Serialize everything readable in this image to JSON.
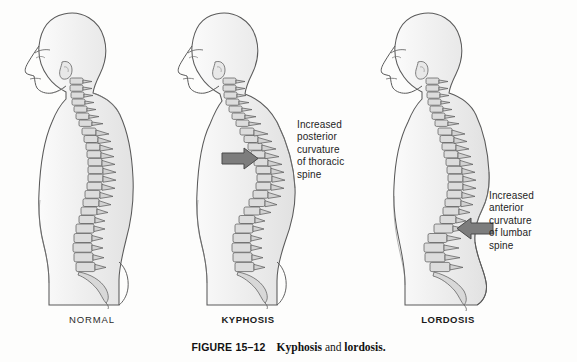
{
  "page": {
    "background_color": "#fdfdfc",
    "ink_color": "#2a2a2a",
    "body_fill": "#efefef",
    "bone_fill": "#d8d8d8",
    "arrow_color": "#7d7d7d",
    "arrow_outline": "#4a4a4a"
  },
  "caption": {
    "figure_number": "FIGURE 15–12",
    "term_1": "Kyphosis",
    "conjunction": " and ",
    "term_2": "lordosis."
  },
  "figures": [
    {
      "id": "normal",
      "label": "NORMAL",
      "label_style": "regular",
      "condition": "normal spinal curvature",
      "description": "Lateral view of a human torso and head showing normal cervical lordosis, thoracic kyphosis and lumbar lordosis of the vertebral column",
      "has_arrow": false,
      "annotation": null
    },
    {
      "id": "kyphosis",
      "label": "KYPHOSIS",
      "label_style": "bold",
      "condition": "exaggerated thoracic curvature",
      "description": "Lateral view showing a pronounced posterior hump of the thoracic spine with forward head posture",
      "has_arrow": true,
      "arrow_direction": "right",
      "annotation": "Increased\nposterior\ncurvature\nof thoracic\nspine"
    },
    {
      "id": "lordosis",
      "label": "LORDOSIS",
      "label_style": "bold",
      "condition": "exaggerated lumbar curvature",
      "description": "Lateral view showing a deep anterior curve of the lumbar spine with protruding abdomen and buttocks",
      "has_arrow": true,
      "arrow_direction": "left",
      "annotation": "Increased\nanterior\ncurvature\nof lumbar\nspine"
    }
  ]
}
